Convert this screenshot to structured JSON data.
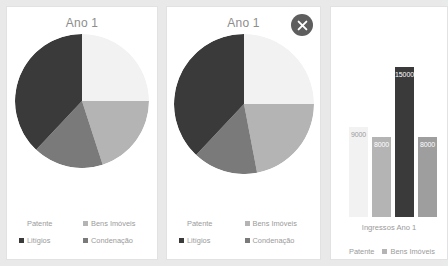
{
  "colors": {
    "background": "#e9e9e9",
    "panel": "#ffffff",
    "panel_border": "#e2e2e2",
    "text_muted": "#9a9a9a",
    "title": "#8d8d8d",
    "close_button_bg": "#5e5e5e",
    "series": {
      "patente": "#f2f2f2",
      "bens_imoveis": "#b4b4b4",
      "litigios": "#3a3a3a",
      "condenacao": "#7a7a7a"
    }
  },
  "panels": [
    {
      "id": "pie-panel-1",
      "title": "Ano 1",
      "has_close_button": false,
      "chart_index": 0
    },
    {
      "id": "pie-panel-2",
      "title": "Ano 1",
      "has_close_button": true,
      "close_icon": "close-icon",
      "chart_index": 1
    },
    {
      "id": "bar-panel",
      "title": "",
      "has_close_button": false,
      "chart_index": 2
    }
  ],
  "legend_items": [
    {
      "label": "Patente",
      "color": "#f2f2f2",
      "swatch_visible": false
    },
    {
      "label": "Bens Imóveis",
      "color": "#b4b4b4",
      "swatch_visible": true
    },
    {
      "label": "Litígios",
      "color": "#3a3a3a",
      "swatch_visible": true
    },
    {
      "label": "Condenação",
      "color": "#7a7a7a",
      "swatch_visible": true
    }
  ],
  "bar_legend_items": [
    {
      "label": "Patente",
      "color": "#f2f2f2",
      "swatch_visible": false
    },
    {
      "label": "Bens Imóveis",
      "color": "#b4b4b4",
      "swatch_visible": true
    }
  ],
  "chart_data": [
    {
      "type": "pie",
      "title": "Ano 1",
      "labels": [
        "Patente",
        "Bens Imóveis",
        "Condenação",
        "Litígios"
      ],
      "values": [
        25,
        20,
        17,
        38
      ],
      "colors": [
        "#f2f2f2",
        "#b4b4b4",
        "#7a7a7a",
        "#3a3a3a"
      ],
      "start_angle": 0,
      "legend_position": "bottom",
      "grid": false
    },
    {
      "type": "pie",
      "title": "Ano 1",
      "labels": [
        "Patente",
        "Bens Imóveis",
        "Condenação",
        "Litígios"
      ],
      "values": [
        25,
        22,
        15,
        38
      ],
      "colors": [
        "#f2f2f2",
        "#b4b4b4",
        "#7a7a7a",
        "#3a3a3a"
      ],
      "start_angle": 0,
      "legend_position": "bottom",
      "grid": false
    },
    {
      "type": "bar",
      "title": "",
      "xlabel": "Ingressos Ano 1",
      "ylabel": "",
      "categories": [
        "Patente",
        "Bens Imóveis",
        "Litígios",
        "Condenação"
      ],
      "values": [
        9000,
        8000,
        15000,
        8000
      ],
      "data_labels": [
        "9000",
        "8000",
        "15000",
        "8000"
      ],
      "colors": [
        "#f2f2f2",
        "#b4b4b4",
        "#3a3a3a",
        "#9e9e9e"
      ],
      "label_colors": [
        "#9a9a9a",
        "#ffffff",
        "#ffffff",
        "#ffffff"
      ],
      "ylim": [
        0,
        17000
      ],
      "grid": false,
      "legend_position": "bottom"
    }
  ]
}
